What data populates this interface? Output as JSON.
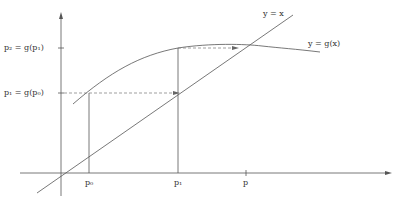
{
  "diagram": {
    "curves": {
      "identity_label": "y = x",
      "g_label": "y = g(x)"
    },
    "y_axis_labels": [
      {
        "id": "p2",
        "text": "p₂ = g(p₁)"
      },
      {
        "id": "p1",
        "text": "p₁ = g(p₀)"
      }
    ],
    "x_axis_labels": [
      {
        "id": "p0",
        "text": "p₀"
      },
      {
        "id": "p1",
        "text": "p₁"
      },
      {
        "id": "p",
        "text": "p"
      }
    ],
    "colors": {
      "line": "#555555",
      "dashed": "#777777",
      "text": "#333333"
    }
  }
}
